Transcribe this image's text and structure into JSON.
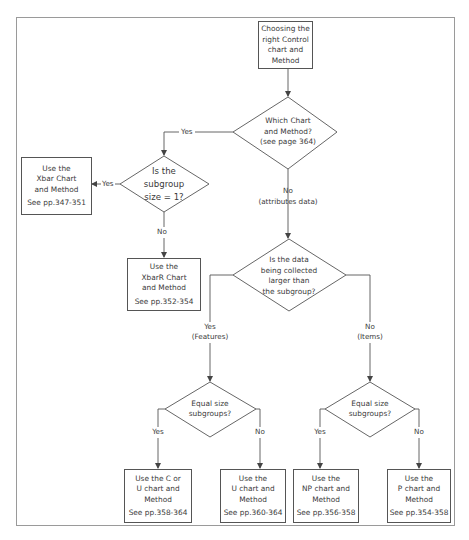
{
  "diagram": {
    "type": "flowchart",
    "colors": {
      "line": "#555555",
      "frame": "#9a9a9a",
      "text": "#3a3a3a",
      "background": "#ffffff"
    },
    "start": {
      "lines": [
        "Choosing the",
        "right Control",
        "chart and",
        "Method"
      ]
    },
    "decision_main": {
      "lines": [
        "Which Chart",
        "and Method?",
        "(see page 364)"
      ]
    },
    "decision_subgroup": {
      "lines": [
        "Is the",
        "subgroup",
        "size = 1?"
      ]
    },
    "decision_data": {
      "lines": [
        "Is the data",
        "being collected",
        "larger than",
        "the subgroup?"
      ]
    },
    "decision_equal_left": {
      "lines": [
        "Equal size",
        "subgroups?"
      ]
    },
    "decision_equal_right": {
      "lines": [
        "Equal size",
        "subgroups?"
      ]
    },
    "labels": {
      "main_yes": "Yes",
      "main_no": "No",
      "main_no_note": "(attributes data)",
      "subgroup_yes": "Yes",
      "subgroup_no": "No",
      "data_yes": "Yes",
      "data_yes_note": "(Features)",
      "data_no": "No",
      "data_no_note": "(Items)",
      "eq_left_yes": "Yes",
      "eq_left_no": "No",
      "eq_right_yes": "Yes",
      "eq_right_no": "No"
    },
    "results": {
      "xbar": {
        "lines": [
          "Use the",
          "Xbar Chart",
          "and Method"
        ],
        "ref": "See pp.347-351"
      },
      "xbarr": {
        "lines": [
          "Use the",
          "XbarR Chart",
          "and Method"
        ],
        "ref": "See pp.352-354"
      },
      "c_or_u": {
        "lines": [
          "Use the C or",
          "U chart and",
          "Method"
        ],
        "ref": "See pp.358-364"
      },
      "u": {
        "lines": [
          "Use the",
          "U chart and",
          "Method"
        ],
        "ref": "See pp.360-364"
      },
      "np": {
        "lines": [
          "Use the",
          "NP chart and",
          "Method"
        ],
        "ref": "See pp.356-358"
      },
      "p": {
        "lines": [
          "Use the",
          "P chart and",
          "Method"
        ],
        "ref": "See pp.354-358"
      }
    }
  }
}
